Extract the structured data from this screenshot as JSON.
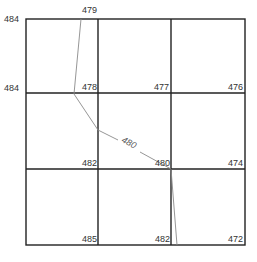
{
  "diagram": {
    "type": "contour-grid",
    "grid": {
      "rows": 3,
      "cols": 3,
      "x_lines": [
        26,
        98,
        171,
        245
      ],
      "y_lines": [
        19,
        93,
        169,
        245
      ]
    },
    "node_values": {
      "top_left": "484",
      "top_mid_contour": "479",
      "row1_left": "484",
      "row1_col1": "478",
      "row1_col2": "477",
      "row1_col3": "476",
      "row2_col1": "482",
      "row2_col2": "480",
      "row2_col3": "474",
      "row3_col1": "485",
      "row3_col2": "482",
      "row3_col3": "472"
    },
    "contour": {
      "label": "480",
      "points": [
        [
          81,
          19
        ],
        [
          74,
          94
        ],
        [
          98,
          130
        ],
        [
          171,
          169
        ],
        [
          177,
          245
        ]
      ]
    },
    "colors": {
      "grid": "#222222",
      "contour": "#8a8a8a",
      "text": "#333333"
    }
  }
}
